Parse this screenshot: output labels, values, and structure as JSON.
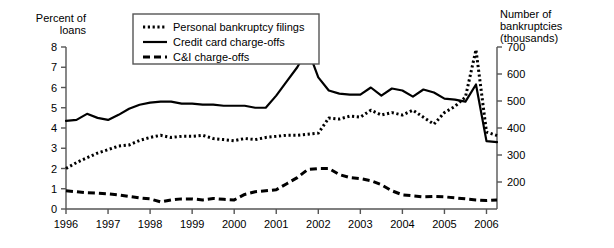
{
  "chart_data": {
    "type": "line",
    "title": "",
    "subtitle": "",
    "xlabel": "",
    "ylabel": "Percent of\nloans",
    "y2label": "Number of bankruptcies\n(thousands)",
    "grid": false,
    "legend_position": "top-center",
    "xlim": [
      1996.0,
      2006.25
    ],
    "ylim": [
      0,
      8
    ],
    "y2lim": [
      100,
      700
    ],
    "xticks": [
      "1996",
      "1997",
      "1998",
      "1999",
      "2000",
      "2001",
      "2002",
      "2003",
      "2004",
      "2005",
      "2006"
    ],
    "xtick_values": [
      1996,
      1997,
      1998,
      1999,
      2000,
      2001,
      2002,
      2003,
      2004,
      2005,
      2006
    ],
    "yticks": [
      "0",
      "1",
      "2",
      "3",
      "4",
      "5",
      "6",
      "7",
      "8"
    ],
    "ytick_values": [
      0,
      1,
      2,
      3,
      4,
      5,
      6,
      7,
      8
    ],
    "y2ticks": [
      "200",
      "300",
      "400",
      "500",
      "600",
      "700"
    ],
    "y2tick_values": [
      200,
      300,
      400,
      500,
      600,
      700
    ],
    "series": [
      {
        "name": "Personal bankruptcy filings",
        "style": "dotted",
        "axis": "right",
        "color": "#000000",
        "x": [
          1996.0,
          1996.25,
          1996.5,
          1996.75,
          1997.0,
          1997.25,
          1997.5,
          1997.75,
          1998.0,
          1998.25,
          1998.5,
          1998.75,
          1999.0,
          1999.25,
          1999.5,
          1999.75,
          2000.0,
          2000.25,
          2000.5,
          2000.75,
          2001.0,
          2001.25,
          2001.5,
          2001.75,
          2002.0,
          2002.25,
          2002.5,
          2002.75,
          2003.0,
          2003.25,
          2003.5,
          2003.75,
          2004.0,
          2004.25,
          2004.5,
          2004.75,
          2005.0,
          2005.25,
          2005.5,
          2005.75,
          2006.0,
          2006.25
        ],
        "values": [
          1.75,
          2.0,
          2.2,
          2.4,
          2.55,
          2.7,
          2.75,
          2.95,
          3.1,
          3.2,
          3.1,
          3.15,
          3.15,
          3.2,
          3.05,
          3.0,
          2.95,
          3.05,
          3.0,
          3.1,
          3.15,
          3.2,
          3.2,
          3.25,
          3.3,
          3.95,
          3.9,
          4.05,
          4.0,
          4.35,
          4.1,
          4.2,
          4.1,
          4.35,
          4.0,
          3.7,
          4.3,
          4.6,
          5.0,
          7.7,
          3.4,
          3.25
        ],
        "values_right": [
          250,
          272,
          290,
          307,
          320,
          333,
          337,
          354,
          365,
          373,
          365,
          369,
          369,
          373,
          361,
          357,
          353,
          361,
          357,
          365,
          369,
          373,
          373,
          377,
          381,
          437,
          433,
          444,
          440,
          466,
          448,
          457,
          448,
          466,
          440,
          414,
          457,
          480,
          515,
          690,
          385,
          372
        ]
      },
      {
        "name": "Credit card charge-offs",
        "style": "solid",
        "axis": "left",
        "color": "#000000",
        "x": [
          1996.0,
          1996.25,
          1996.5,
          1996.75,
          1997.0,
          1997.25,
          1997.5,
          1997.75,
          1998.0,
          1998.25,
          1998.5,
          1998.75,
          1999.0,
          1999.25,
          1999.5,
          1999.75,
          2000.0,
          2000.25,
          2000.5,
          2000.75,
          2001.0,
          2001.25,
          2001.5,
          2001.75,
          2002.0,
          2002.25,
          2002.5,
          2002.75,
          2003.0,
          2003.25,
          2003.5,
          2003.75,
          2004.0,
          2004.25,
          2004.5,
          2004.75,
          2005.0,
          2005.25,
          2005.5,
          2005.75,
          2006.0,
          2006.25
        ],
        "values": [
          4.35,
          4.4,
          4.7,
          4.5,
          4.4,
          4.65,
          4.95,
          5.15,
          5.25,
          5.3,
          5.3,
          5.2,
          5.2,
          5.15,
          5.15,
          5.1,
          5.1,
          5.1,
          5.0,
          5.0,
          5.6,
          6.3,
          7.0,
          7.9,
          6.5,
          5.85,
          5.7,
          5.65,
          5.65,
          6.0,
          5.6,
          5.95,
          5.85,
          5.55,
          5.9,
          5.75,
          5.45,
          5.4,
          5.3,
          6.15,
          3.35,
          3.3
        ],
        "note": "2002 peak is the maximum at about 7.9; 2005Q4 secondary spike to about 6.15 then a sharp drop to about 3.3 in 2006"
      },
      {
        "name": "C&I charge-offs",
        "style": "dashed",
        "axis": "left",
        "color": "#000000",
        "x": [
          1996.0,
          1996.25,
          1996.5,
          1996.75,
          1997.0,
          1997.25,
          1997.5,
          1997.75,
          1998.0,
          1998.25,
          1998.5,
          1998.75,
          1999.0,
          1999.25,
          1999.5,
          1999.75,
          2000.0,
          2000.25,
          2000.5,
          2000.75,
          2001.0,
          2001.25,
          2001.5,
          2001.75,
          2002.0,
          2002.25,
          2002.5,
          2002.75,
          2003.0,
          2003.25,
          2003.5,
          2003.75,
          2004.0,
          2004.25,
          2004.5,
          2004.75,
          2005.0,
          2005.25,
          2005.5,
          2005.75,
          2006.0,
          2006.25
        ],
        "values": [
          0.9,
          0.85,
          0.8,
          0.78,
          0.75,
          0.7,
          0.62,
          0.55,
          0.5,
          0.35,
          0.45,
          0.5,
          0.5,
          0.45,
          0.52,
          0.48,
          0.45,
          0.72,
          0.85,
          0.9,
          0.95,
          1.25,
          1.55,
          1.95,
          2.0,
          2.0,
          1.7,
          1.55,
          1.5,
          1.4,
          1.2,
          0.9,
          0.7,
          0.65,
          0.6,
          0.62,
          0.6,
          0.55,
          0.5,
          0.45,
          0.42,
          0.45
        ]
      }
    ]
  },
  "legend": {
    "items": [
      {
        "label": "Personal bankruptcy filings",
        "style": "dotted"
      },
      {
        "label": "Credit card charge-offs",
        "style": "solid"
      },
      {
        "label": "C&I charge-offs",
        "style": "dashed"
      }
    ]
  },
  "axes": {
    "left_title": "Percent of\nloans",
    "right_title": "Number of bankruptcies\n(thousands)"
  }
}
